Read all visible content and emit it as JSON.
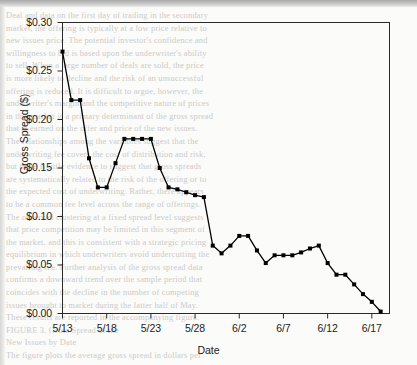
{
  "chart_data": {
    "type": "line",
    "title": "",
    "xlabel": "Date",
    "ylabel": "Gross Spread ($)",
    "ylim": [
      0.0,
      0.3
    ],
    "ytick_values": [
      0.0,
      0.05,
      0.1,
      0.15,
      0.2,
      0.25,
      0.3
    ],
    "ytick_labels": [
      "$0.00",
      "$0.05",
      "$0.10",
      "$0.15",
      "$0.20",
      "$0.25",
      "$0.30"
    ],
    "xtick_labels": [
      "5/13",
      "5/18",
      "5/23",
      "5/28",
      "6/2",
      "6/7",
      "6/12",
      "6/17"
    ],
    "xtick_index": [
      0,
      5,
      10,
      15,
      20,
      25,
      30,
      35
    ],
    "grid": false,
    "legend": false,
    "marker": "filled-square",
    "line_color": "#000000",
    "marker_color": "#000000",
    "x": [
      "5/13",
      "5/14",
      "5/15",
      "5/16",
      "5/17",
      "5/18",
      "5/19",
      "5/20",
      "5/21",
      "5/22",
      "5/23",
      "5/24",
      "5/25",
      "5/26",
      "5/27",
      "5/28",
      "5/29",
      "5/30",
      "5/31",
      "6/1",
      "6/2",
      "6/3",
      "6/4",
      "6/5",
      "6/6",
      "6/7",
      "6/8",
      "6/9",
      "6/10",
      "6/11",
      "6/12",
      "6/13",
      "6/14",
      "6/15",
      "6/16",
      "6/17",
      "6/18"
    ],
    "values": [
      0.27,
      0.22,
      0.22,
      0.16,
      0.13,
      0.13,
      0.155,
      0.18,
      0.18,
      0.18,
      0.18,
      0.15,
      0.13,
      0.128,
      0.125,
      0.122,
      0.12,
      0.07,
      0.062,
      0.07,
      0.08,
      0.08,
      0.065,
      0.052,
      0.06,
      0.06,
      0.06,
      0.063,
      0.067,
      0.07,
      0.052,
      0.04,
      0.04,
      0.03,
      0.02,
      0.012,
      0.002
    ]
  },
  "bleed_text": [
    "Deal and data on the first day of trading in the secondary",
    "market, the offering is typically at a low price relative to",
    "new issues price. The potential investor's confidence and",
    "willingness to bid is based upon the underwriter's ability",
    "to sell. When a large number of deals are sold, the price",
    "is more likely to decline and the risk of an unsuccessful",
    "offering is reduced. It is difficult to argue, however, the",
    "underwriter's margin and the competitive nature of prices",
    "in this market is a primary determinant of the gross spread",
    "that is earned on the offer and price of the new issues.",
    "The relationships among the variables suggest that the",
    "underwriting fee covers the cost of distribution and risk,",
    "but there is little evidence to suggest that gross spreads",
    "are systematically related to the risk of the offering or to",
    "the expected cost of underwriting. Rather, there appears",
    "to be a common fee level across the range of offerings.",
    "The observed clustering at a fixed spread level suggests",
    "that price competition may be limited in this segment of",
    "the market, and this is consistent with a strategic pricing",
    "equilibrium in which underwriters avoid undercutting the",
    "prevailing fee. Further analysis of the gross spread data",
    "confirms a downward trend over the sample period that",
    "coincides with the decline in the number of competing",
    "issues brought to market during the latter half of May.",
    "These results are reported in the accompanying figure.",
    "",
    "",
    "FIGURE 3.   Gross Spread of the",
    "New Issues by Date",
    "",
    "The figure plots the average gross spread in dollars per",
    "share. The sample period is from May 13 through June 18",
    "and includes all issues for which pricing data were",
    "available from the offering prospectus of the deal."
  ]
}
